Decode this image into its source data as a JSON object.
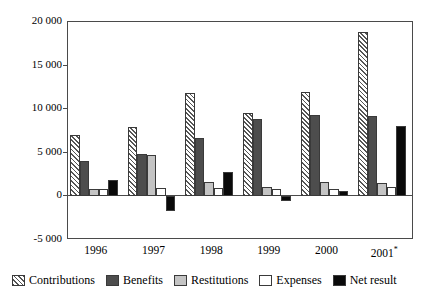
{
  "chart_data": {
    "type": "bar",
    "title": "",
    "xlabel": "",
    "ylabel": "",
    "ylim": [
      -5000,
      20000
    ],
    "grid": false,
    "legend_position": "bottom",
    "categories": [
      "1996",
      "1997",
      "1998",
      "1999",
      "2000",
      "2001*"
    ],
    "ytick_labels": [
      "20 000",
      "15 000",
      "10 000",
      "5 000",
      "0",
      "-5 000"
    ],
    "ytick_values": [
      20000,
      15000,
      10000,
      5000,
      0,
      -5000
    ],
    "series": [
      {
        "name": "Contributions",
        "pattern": "diagonal-hatch",
        "color": "#ffffff",
        "values": [
          7000,
          8000,
          11900,
          9600,
          12000,
          18900
        ]
      },
      {
        "name": "Benefits",
        "pattern": "solid-dark-gray",
        "color": "#4d4d4d",
        "values": [
          4100,
          4900,
          6700,
          8900,
          9300,
          9200
        ]
      },
      {
        "name": "Restitutions",
        "pattern": "solid-light-gray",
        "color": "#c4c4c4",
        "values": [
          900,
          4800,
          1700,
          1100,
          1600,
          1500
        ]
      },
      {
        "name": "Expenses",
        "pattern": "solid-white",
        "color": "#ffffff",
        "values": [
          800,
          1000,
          1000,
          900,
          900,
          1100
        ]
      },
      {
        "name": "Net result",
        "pattern": "solid-black",
        "color": "#0a0a0a",
        "values": [
          1900,
          -1700,
          2800,
          -500,
          600,
          8100
        ]
      }
    ]
  },
  "legend": {
    "items": [
      {
        "label": "Contributions"
      },
      {
        "label": "Benefits"
      },
      {
        "label": "Restitutions"
      },
      {
        "label": "Expenses"
      },
      {
        "label": "Net result"
      }
    ]
  }
}
